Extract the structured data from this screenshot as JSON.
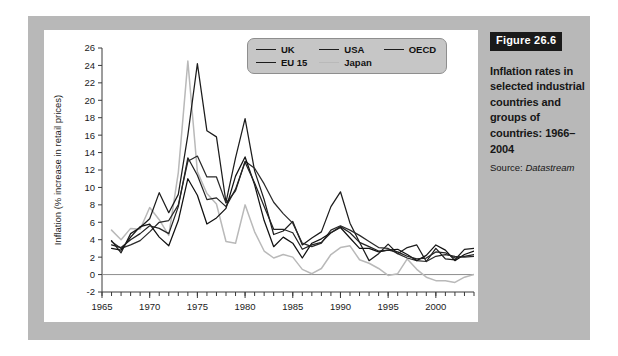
{
  "caption": {
    "figure_number": "Figure 26.6",
    "title": "Inflation rates in selected industrial countries and groups of countries: 1966–2004",
    "source_label": "Source:",
    "source_value": "Datastream"
  },
  "legend": {
    "items": [
      {
        "label": "UK",
        "color": "#1c1c1c"
      },
      {
        "label": "USA",
        "color": "#1c1c1c"
      },
      {
        "label": "OECD",
        "color": "#1c1c1c"
      },
      {
        "label": "EU 15",
        "color": "#1c1c1c"
      },
      {
        "label": "Japan",
        "color": "#b9b9b9"
      }
    ]
  },
  "chart_data": {
    "type": "line",
    "title": "Inflation rates in selected industrial countries and groups of countries: 1966–2004",
    "xlabel": "",
    "ylabel": "Inflation (% increase in retail prices)",
    "xlim": [
      1965,
      2004
    ],
    "ylim": [
      -2,
      26
    ],
    "ytick_step": 2,
    "yticks": [
      -2,
      0,
      2,
      4,
      6,
      8,
      10,
      12,
      14,
      16,
      18,
      20,
      22,
      24,
      26
    ],
    "xticks": [
      1965,
      1970,
      1975,
      1980,
      1985,
      1990,
      1995,
      2000
    ],
    "xtick_labels": [
      "1965",
      "1970",
      "1975",
      "1980",
      "1985",
      "1990",
      "1995",
      "2000"
    ],
    "xtick_minor_step": 1,
    "grid": false,
    "zero_line": true,
    "legend_position": "top-center",
    "x": [
      1966,
      1967,
      1968,
      1969,
      1970,
      1971,
      1972,
      1973,
      1974,
      1975,
      1976,
      1977,
      1978,
      1979,
      1980,
      1981,
      1982,
      1983,
      1984,
      1985,
      1986,
      1987,
      1988,
      1989,
      1990,
      1991,
      1992,
      1993,
      1994,
      1995,
      1996,
      1997,
      1998,
      1999,
      2000,
      2001,
      2002,
      2003,
      2004
    ],
    "series": [
      {
        "name": "UK",
        "color": "#1c1c1c",
        "values": [
          3.9,
          2.5,
          4.7,
          5.4,
          6.4,
          9.4,
          7.1,
          9.2,
          16.0,
          24.2,
          16.5,
          15.8,
          8.3,
          13.4,
          17.9,
          11.9,
          8.6,
          4.6,
          5.0,
          6.1,
          3.4,
          4.2,
          4.9,
          7.8,
          9.5,
          5.9,
          3.7,
          1.6,
          2.4,
          3.5,
          2.4,
          3.1,
          3.4,
          1.5,
          3.0,
          1.8,
          1.7,
          2.9,
          3.0
        ]
      },
      {
        "name": "EU 15",
        "color": "#2a2a2a",
        "values": [
          3.8,
          3.0,
          3.4,
          3.9,
          4.9,
          6.0,
          6.2,
          8.0,
          13.0,
          13.6,
          11.2,
          11.2,
          8.2,
          9.6,
          13.0,
          12.2,
          10.4,
          8.3,
          7.0,
          5.9,
          3.6,
          3.2,
          3.6,
          5.1,
          5.6,
          5.1,
          4.5,
          3.8,
          3.1,
          3.0,
          2.4,
          1.9,
          1.6,
          1.5,
          2.1,
          2.3,
          2.1,
          2.0,
          2.1
        ]
      },
      {
        "name": "USA",
        "color": "#111111",
        "values": [
          3.0,
          2.8,
          4.3,
          5.5,
          5.8,
          4.3,
          3.3,
          6.2,
          11.0,
          9.1,
          5.8,
          6.5,
          7.6,
          11.3,
          13.5,
          10.3,
          6.2,
          3.2,
          4.3,
          3.6,
          1.9,
          3.6,
          4.1,
          4.8,
          5.4,
          4.2,
          3.0,
          3.0,
          2.6,
          2.8,
          2.9,
          2.3,
          1.6,
          2.2,
          3.4,
          2.8,
          1.6,
          2.3,
          2.7
        ]
      },
      {
        "name": "OECD",
        "color": "#232323",
        "values": [
          3.4,
          3.1,
          4.0,
          4.7,
          5.6,
          5.3,
          4.7,
          7.8,
          13.4,
          11.4,
          8.6,
          8.8,
          7.8,
          9.8,
          12.9,
          10.5,
          7.8,
          5.2,
          5.2,
          4.8,
          2.9,
          3.4,
          3.7,
          4.8,
          5.5,
          4.8,
          3.7,
          3.2,
          2.7,
          2.8,
          2.6,
          2.1,
          1.8,
          1.9,
          2.6,
          2.5,
          1.9,
          2.1,
          2.3
        ]
      },
      {
        "name": "Japan",
        "color": "#b9b9b9",
        "values": [
          5.1,
          4.0,
          5.3,
          5.2,
          7.7,
          6.3,
          4.5,
          11.7,
          24.5,
          11.8,
          9.3,
          8.1,
          3.8,
          3.6,
          8.0,
          4.9,
          2.7,
          1.9,
          2.3,
          2.0,
          0.6,
          0.1,
          0.7,
          2.3,
          3.1,
          3.3,
          1.7,
          1.3,
          0.7,
          -0.1,
          0.1,
          1.8,
          0.6,
          -0.3,
          -0.7,
          -0.7,
          -0.9,
          -0.3,
          0.0
        ]
      }
    ]
  }
}
